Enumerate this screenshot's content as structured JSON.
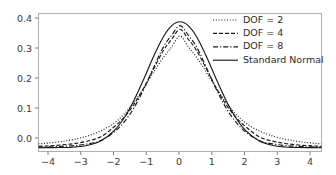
{
  "chart_data": {
    "type": "line",
    "title": "",
    "xlabel": "",
    "ylabel": "",
    "xlim": [
      -4.3,
      4.3
    ],
    "ylim": [
      -0.012,
      0.425
    ],
    "xticks": [
      -4,
      -3,
      -2,
      -1,
      0,
      1,
      2,
      3,
      4
    ],
    "xtick_labels": [
      "−4",
      "−3",
      "−2",
      "−1",
      "0",
      "1",
      "2",
      "3",
      "4"
    ],
    "yticks": [
      0.0,
      0.1,
      0.2,
      0.3,
      0.4
    ],
    "ytick_labels": [
      "0.0",
      "0.1",
      "0.2",
      "0.3",
      "0.4"
    ],
    "grid": false,
    "legend_position": "upper right",
    "legend_frame": false,
    "series": [
      {
        "name": "DOF = 2",
        "linestyle": "dotted",
        "color": "#1a1a1a",
        "peak": 0.3536,
        "x": [
          -4.3,
          -4.0,
          -3.6,
          -3.2,
          -2.8,
          -2.4,
          -2.0,
          -1.7,
          -1.4,
          -1.1,
          -0.8,
          -0.5,
          -0.25,
          0.0,
          0.25,
          0.5,
          0.8,
          1.1,
          1.4,
          1.7,
          2.0,
          2.4,
          2.8,
          3.2,
          3.6,
          4.0,
          4.3
        ],
        "y": [
          0.0122,
          0.0149,
          0.0197,
          0.0268,
          0.0375,
          0.0537,
          0.078,
          0.1063,
          0.1434,
          0.1888,
          0.2391,
          0.2868,
          0.3196,
          0.3536,
          0.3196,
          0.2868,
          0.2391,
          0.1888,
          0.1434,
          0.1063,
          0.078,
          0.0537,
          0.0375,
          0.0268,
          0.0197,
          0.0149,
          0.0122
        ]
      },
      {
        "name": "DOF = 4",
        "linestyle": "dashed",
        "color": "#1a1a1a",
        "peak": 0.375,
        "x": [
          -4.3,
          -4.0,
          -3.6,
          -3.2,
          -2.8,
          -2.4,
          -2.0,
          -1.7,
          -1.4,
          -1.1,
          -0.8,
          -0.5,
          -0.25,
          0.0,
          0.25,
          0.5,
          0.8,
          1.1,
          1.4,
          1.7,
          2.0,
          2.4,
          2.8,
          3.2,
          3.6,
          4.0,
          4.3
        ],
        "y": [
          0.0045,
          0.0059,
          0.0087,
          0.0133,
          0.0211,
          0.035,
          0.0663,
          0.0961,
          0.1367,
          0.1893,
          0.2498,
          0.3087,
          0.3435,
          0.375,
          0.3435,
          0.3087,
          0.2498,
          0.1893,
          0.1367,
          0.0961,
          0.0663,
          0.035,
          0.0211,
          0.0133,
          0.0087,
          0.0059,
          0.0045
        ]
      },
      {
        "name": "DOF = 8",
        "linestyle": "dashdot",
        "color": "#1a1a1a",
        "peak": 0.3867,
        "x": [
          -4.3,
          -4.0,
          -3.6,
          -3.2,
          -2.8,
          -2.4,
          -2.0,
          -1.7,
          -1.4,
          -1.1,
          -0.8,
          -0.5,
          -0.25,
          0.0,
          0.25,
          0.5,
          0.8,
          1.1,
          1.4,
          1.7,
          2.0,
          2.4,
          2.8,
          3.2,
          3.6,
          4.0,
          4.3
        ],
        "y": [
          0.0019,
          0.0026,
          0.0041,
          0.0069,
          0.0122,
          0.0225,
          0.0497,
          0.0811,
          0.126,
          0.1856,
          0.2544,
          0.3199,
          0.3567,
          0.3867,
          0.3567,
          0.3199,
          0.2544,
          0.1856,
          0.126,
          0.0811,
          0.0497,
          0.0225,
          0.0122,
          0.0069,
          0.0041,
          0.0026,
          0.0019
        ]
      },
      {
        "name": "Standard Normal",
        "linestyle": "solid",
        "color": "#1a1a1a",
        "peak": 0.3989,
        "x": [
          -4.3,
          -4.0,
          -3.6,
          -3.2,
          -2.8,
          -2.4,
          -2.0,
          -1.7,
          -1.4,
          -1.1,
          -0.8,
          -0.5,
          -0.25,
          0.0,
          0.25,
          0.5,
          0.8,
          1.1,
          1.4,
          1.7,
          2.0,
          2.4,
          2.8,
          3.2,
          3.6,
          4.0,
          4.3
        ],
        "y": [
          4e-05,
          0.00013,
          0.00061,
          0.00238,
          0.00792,
          0.02239,
          0.05399,
          0.09405,
          0.14973,
          0.21785,
          0.28969,
          0.35207,
          0.38667,
          0.39894,
          0.38667,
          0.35207,
          0.28969,
          0.21785,
          0.14973,
          0.09405,
          0.05399,
          0.02239,
          0.00792,
          0.00238,
          0.00061,
          0.00013,
          4e-05
        ]
      }
    ]
  },
  "legend": {
    "entries": [
      {
        "label": "DOF = 2",
        "style": "dotted"
      },
      {
        "label": "DOF = 4",
        "style": "dashed"
      },
      {
        "label": "DOF = 8",
        "style": "dashdot"
      },
      {
        "label": "Standard Normal",
        "style": "solid"
      }
    ]
  },
  "axes": {
    "x_tick_0": "−4",
    "x_tick_1": "−3",
    "x_tick_2": "−2",
    "x_tick_3": "−1",
    "x_tick_4": "0",
    "x_tick_5": "1",
    "x_tick_6": "2",
    "x_tick_7": "3",
    "x_tick_8": "4",
    "y_tick_0": "0.0",
    "y_tick_1": "0.1",
    "y_tick_2": "0.2",
    "y_tick_3": "0.3",
    "y_tick_4": "0.4"
  },
  "colors": {
    "background": "#ffffff",
    "line": "#1a1a1a",
    "spine": "#b0b0b0",
    "tick_text": "#3b3b3b"
  }
}
